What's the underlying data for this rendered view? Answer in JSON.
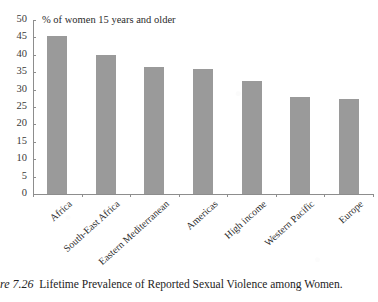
{
  "chart_data": {
    "type": "bar",
    "title": "% of women 15 years and older",
    "xlabel": "",
    "ylabel": "",
    "ylim": [
      0,
      50
    ],
    "ytick_step": 5,
    "yticks": [
      "50",
      "45",
      "40",
      "35",
      "30",
      "25",
      "20",
      "15",
      "10",
      "5",
      "0"
    ],
    "grid": false,
    "legend": "none",
    "bar_color": "#9a9a9a",
    "categories": [
      "Africa",
      "South-East Africa",
      "Eastern Mediterranean",
      "Americas",
      "High income",
      "Western Pacific",
      "Europe"
    ],
    "values": [
      45.5,
      40.0,
      36.5,
      36.0,
      32.5,
      27.8,
      27.2
    ]
  },
  "caption": {
    "figure_number": "re 7.26",
    "text": "Lifetime Prevalence of Reported Sexual Violence among Women."
  }
}
